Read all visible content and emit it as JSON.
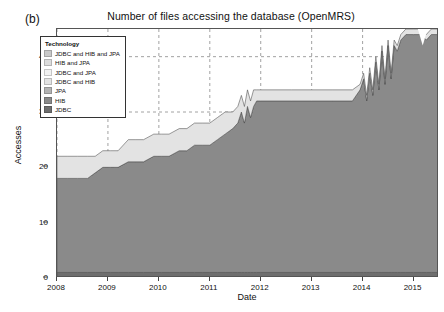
{
  "panel": {
    "label": "(b)"
  },
  "chart_data": {
    "type": "area",
    "stacked": true,
    "title": "Number of files accessing the database (OpenMRS)",
    "xlabel": "Date",
    "ylabel": "Accesses",
    "xlim": [
      2008.0,
      2015.5
    ],
    "ylim": [
      0,
      45
    ],
    "yticks": [
      0,
      10,
      20,
      30,
      40
    ],
    "xticks": [
      2008,
      2009,
      2010,
      2011,
      2012,
      2013,
      2014,
      2015
    ],
    "grid": "dashed-gray",
    "legend": {
      "title": "Technology",
      "position": "upper-left-inside",
      "entries": [
        {
          "label": "JDBC and HIB and JPA",
          "color": "#c9c9c9"
        },
        {
          "label": "HIB and JPA",
          "color": "#dcdcdc"
        },
        {
          "label": "JDBC and JPA",
          "color": "#f2f2f2"
        },
        {
          "label": "JDBC and HIB",
          "color": "#e3e3e3"
        },
        {
          "label": "JPA",
          "color": "#b4b4b4"
        },
        {
          "label": "HIB",
          "color": "#8a8a8a"
        },
        {
          "label": "JDBC",
          "color": "#6e6e6e"
        }
      ]
    },
    "x": [
      2008.0,
      2008.2,
      2008.4,
      2008.6,
      2008.75,
      2008.9,
      2009.05,
      2009.2,
      2009.4,
      2009.55,
      2009.7,
      2009.9,
      2010.05,
      2010.2,
      2010.4,
      2010.55,
      2010.7,
      2010.85,
      2011.0,
      2011.15,
      2011.3,
      2011.45,
      2011.55,
      2011.62,
      2011.68,
      2011.74,
      2011.8,
      2011.86,
      2011.92,
      2012.0,
      2012.3,
      2012.6,
      2013.0,
      2013.4,
      2013.8,
      2013.95,
      2014.02,
      2014.08,
      2014.14,
      2014.2,
      2014.26,
      2014.32,
      2014.38,
      2014.44,
      2014.5,
      2014.56,
      2014.62,
      2014.68,
      2014.75,
      2014.85,
      2015.0,
      2015.15,
      2015.25,
      2015.35,
      2015.5
    ],
    "series": [
      {
        "name": "JDBC",
        "values": [
          1,
          1,
          1,
          1,
          1,
          1,
          1,
          1,
          1,
          1,
          1,
          1,
          1,
          1,
          1,
          1,
          1,
          1,
          1,
          1,
          1,
          1,
          1,
          1,
          1,
          1,
          1,
          1,
          1,
          1,
          1,
          1,
          1,
          1,
          1,
          1,
          1,
          1,
          1,
          1,
          1,
          1,
          1,
          1,
          1,
          1,
          1,
          1,
          1,
          1,
          1,
          1,
          1,
          1,
          1
        ]
      },
      {
        "name": "HIB",
        "values": [
          17,
          17,
          17,
          17,
          18,
          19,
          19,
          19,
          20,
          20,
          20,
          21,
          21,
          21,
          22,
          22,
          23,
          23,
          23,
          24,
          25,
          26,
          27,
          29,
          27,
          30,
          28,
          30,
          31,
          31,
          31,
          31,
          31,
          31,
          31,
          33,
          35,
          31,
          36,
          32,
          38,
          33,
          40,
          34,
          41,
          35,
          41,
          40,
          42,
          43,
          43,
          43,
          42,
          43,
          43
        ]
      },
      {
        "name": "JPA",
        "values": [
          0,
          0,
          0,
          0,
          0,
          0,
          0,
          0,
          0,
          0,
          0,
          0,
          0,
          0,
          0,
          0,
          0,
          0,
          0,
          0,
          0,
          0,
          0,
          0,
          0,
          0,
          0,
          0,
          0,
          0,
          0,
          0,
          0,
          0,
          0,
          0,
          0,
          0,
          0,
          0,
          0,
          0,
          0,
          0,
          0,
          0,
          0,
          0,
          0,
          0,
          0,
          0,
          0,
          0,
          0
        ]
      },
      {
        "name": "JDBC and HIB",
        "values": [
          4,
          4,
          4,
          4,
          3,
          3,
          3,
          3,
          4,
          4,
          4,
          4,
          4,
          4,
          4,
          4,
          4,
          4,
          4,
          4,
          4,
          3,
          3,
          3,
          3,
          3,
          3,
          3,
          2,
          2,
          2,
          2,
          2,
          2,
          2,
          1,
          1,
          1,
          1,
          1,
          1,
          1,
          1,
          1,
          1,
          1,
          1,
          1,
          1,
          1,
          1,
          1,
          1,
          1,
          1
        ]
      },
      {
        "name": "JDBC and JPA",
        "values": [
          0,
          0,
          0,
          0,
          0,
          0,
          0,
          0,
          0,
          0,
          0,
          0,
          0,
          0,
          0,
          0,
          0,
          0,
          0,
          0,
          0,
          0,
          0,
          0,
          0,
          0,
          0,
          0,
          0,
          0,
          0,
          0,
          0,
          0,
          0,
          0,
          0,
          0,
          0,
          0,
          0,
          0,
          0,
          0,
          0,
          0,
          0,
          0,
          0,
          0,
          0,
          0,
          0,
          0,
          0
        ]
      },
      {
        "name": "HIB and JPA",
        "values": [
          0,
          0,
          0,
          0,
          0,
          0,
          0,
          0,
          0,
          0,
          0,
          0,
          0,
          0,
          0,
          0,
          0,
          0,
          0,
          0,
          0,
          0,
          0,
          0,
          0,
          0,
          0,
          0,
          0,
          0,
          0,
          0,
          0,
          0,
          0,
          0,
          0,
          0,
          0,
          0,
          0,
          0,
          0,
          0,
          0,
          0,
          0,
          0,
          0,
          0,
          0,
          0,
          0,
          0,
          0
        ]
      },
      {
        "name": "JDBC and HIB and JPA",
        "values": [
          0,
          0,
          0,
          0,
          0,
          0,
          0,
          0,
          0,
          0,
          0,
          0,
          0,
          0,
          0,
          0,
          0,
          0,
          0,
          0,
          0,
          0,
          0,
          0,
          0,
          0,
          0,
          0,
          0,
          0,
          0,
          0,
          0,
          0,
          0,
          0,
          0,
          0,
          0,
          0,
          0,
          0,
          0,
          0,
          0,
          0,
          0,
          0,
          0,
          0,
          0,
          0,
          0,
          0,
          0
        ]
      }
    ],
    "notch": {
      "x": 2015.18,
      "depth": 2,
      "description": "dip in top band near 2015"
    }
  }
}
